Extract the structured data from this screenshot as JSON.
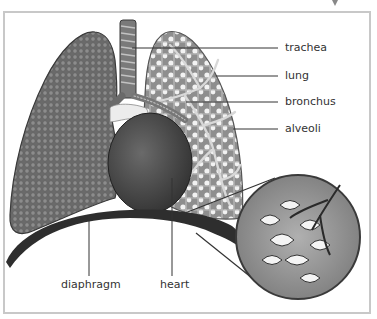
{
  "diagram": {
    "style": "grayscale illustration",
    "labels": [
      {
        "id": "trachea",
        "text": "trachea"
      },
      {
        "id": "lung",
        "text": "lung"
      },
      {
        "id": "bronchus",
        "text": "bronchus"
      },
      {
        "id": "alveoli",
        "text": "alveoli"
      },
      {
        "id": "diaphragm",
        "text": "diaphragm"
      },
      {
        "id": "heart",
        "text": "heart"
      }
    ],
    "parts": [
      "left-lung (textured exterior)",
      "right-lung (cut-away showing bronchial tree and alveoli)",
      "trachea",
      "bronchi",
      "heart",
      "diaphragm",
      "magnified alveoli inset"
    ],
    "colors": {
      "frame": "#c8c8c8",
      "lung_exterior": "#6e6e6e",
      "lung_interior": "#9a9a9a",
      "heart": "#4a4a4a",
      "diaphragm": "#2e2e2e",
      "inset_bg": "#8a8a8a",
      "leader_line": "#333333"
    }
  }
}
